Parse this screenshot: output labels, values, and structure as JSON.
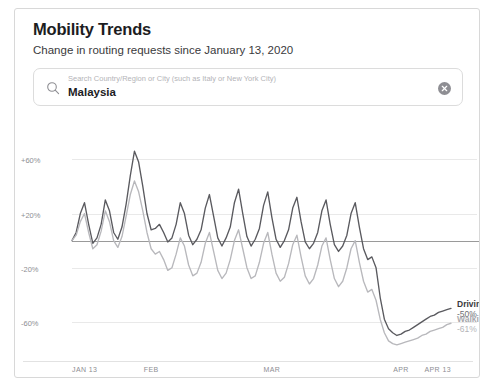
{
  "header": {
    "title": "Mobility Trends",
    "subtitle": "Change in routing requests since January 13, 2020"
  },
  "search": {
    "placeholder": "Search Country/Region or City (such as Italy or New York City)",
    "value": "Malaysia",
    "search_icon": "search-icon",
    "clear_icon": "clear-circle-icon"
  },
  "chart_data": {
    "type": "line",
    "title": "Mobility Trends",
    "subtitle": "Change in routing requests since January 13, 2020",
    "xlabel": "",
    "ylabel": "",
    "ylim": [
      -80,
      75
    ],
    "yticks": [
      60,
      20,
      -20,
      -60
    ],
    "ytick_labels": [
      "+60%",
      "+20%",
      "-20%",
      "-60%"
    ],
    "grid": true,
    "baseline": 0,
    "baseline_label": "Baseline",
    "legend_position": "right-end",
    "xtick_labels": [
      "JAN 13",
      "FEB",
      "MAR",
      "APR",
      "APR 13"
    ],
    "xtick_positions": [
      0,
      19,
      48,
      79,
      91
    ],
    "x_start_label": "JAN 13",
    "x_end_label": "APR 13",
    "x": [
      0,
      1,
      2,
      3,
      4,
      5,
      6,
      7,
      8,
      9,
      10,
      11,
      12,
      13,
      14,
      15,
      16,
      17,
      18,
      19,
      20,
      21,
      22,
      23,
      24,
      25,
      26,
      27,
      28,
      29,
      30,
      31,
      32,
      33,
      34,
      35,
      36,
      37,
      38,
      39,
      40,
      41,
      42,
      43,
      44,
      45,
      46,
      47,
      48,
      49,
      50,
      51,
      52,
      53,
      54,
      55,
      56,
      57,
      58,
      59,
      60,
      61,
      62,
      63,
      64,
      65,
      66,
      67,
      68,
      69,
      70,
      71,
      72,
      73,
      74,
      75,
      76,
      77,
      78,
      79,
      80,
      81,
      82,
      83,
      84,
      85,
      86,
      87,
      88,
      89,
      90,
      91
    ],
    "series": [
      {
        "name": "Driving",
        "end_value_label": "-50%",
        "color": "#5a5a5f",
        "values": [
          0,
          6,
          20,
          28,
          12,
          -2,
          2,
          12,
          30,
          22,
          6,
          1,
          10,
          27,
          48,
          66,
          58,
          40,
          20,
          8,
          9,
          12,
          6,
          -1,
          2,
          12,
          28,
          20,
          4,
          -3,
          1,
          8,
          24,
          34,
          18,
          2,
          -4,
          2,
          10,
          28,
          38,
          20,
          3,
          -4,
          1,
          9,
          26,
          36,
          17,
          1,
          -5,
          0,
          8,
          24,
          32,
          14,
          -1,
          -6,
          -2,
          6,
          22,
          30,
          12,
          -3,
          -8,
          -4,
          4,
          20,
          28,
          10,
          -6,
          -14,
          -12,
          -20,
          -42,
          -58,
          -65,
          -68,
          -70,
          -69,
          -67,
          -66,
          -64,
          -62,
          -60,
          -58,
          -56,
          -55,
          -53,
          -52,
          -51,
          -50
        ]
      },
      {
        "name": "Walking",
        "end_value_label": "-61%",
        "color": "#b8b8bc",
        "values": [
          0,
          4,
          14,
          20,
          6,
          -6,
          -3,
          7,
          22,
          14,
          0,
          -5,
          3,
          18,
          34,
          44,
          36,
          22,
          6,
          -6,
          -10,
          -8,
          -14,
          -22,
          -20,
          -10,
          2,
          -4,
          -18,
          -26,
          -24,
          -16,
          -2,
          6,
          -8,
          -22,
          -28,
          -24,
          -14,
          0,
          8,
          -6,
          -20,
          -28,
          -26,
          -16,
          -2,
          6,
          -10,
          -24,
          -30,
          -27,
          -17,
          -3,
          4,
          -12,
          -26,
          -32,
          -28,
          -18,
          -4,
          2,
          -14,
          -28,
          -34,
          -30,
          -20,
          -6,
          0,
          -16,
          -30,
          -38,
          -36,
          -44,
          -58,
          -68,
          -74,
          -76,
          -77,
          -76,
          -75,
          -74,
          -73,
          -72,
          -70,
          -69,
          -67,
          -66,
          -65,
          -64,
          -62,
          -61
        ]
      }
    ]
  }
}
